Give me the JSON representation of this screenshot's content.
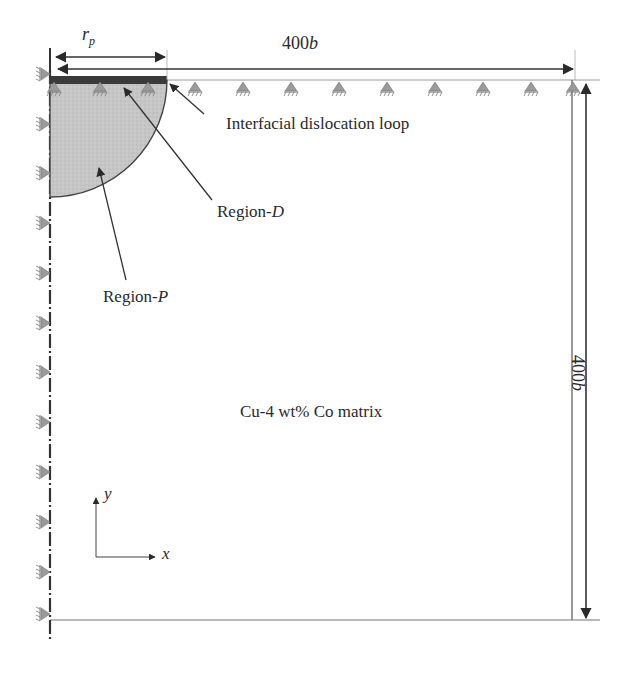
{
  "figure": {
    "type": "finite-element model schematic",
    "labels": {
      "rp_main": "r",
      "rp_sub": "p",
      "width_dim": "400",
      "width_dim_unit": "b",
      "height_dim": "400",
      "height_dim_unit": "b",
      "interfacial_loop": "Interfacial dislocation loop",
      "region_d_prefix": "Region-",
      "region_d_suffix": "D",
      "region_p_prefix": "Region-",
      "region_p_suffix": "P",
      "matrix": "Cu-4 wt% Co matrix",
      "axis_x": "x",
      "axis_y": "y"
    },
    "colors": {
      "line": "#3a3a3a",
      "region_p_fill": "#c8c8c8",
      "region_d_fill": "#3a3a3a",
      "support_fill": "#9a9a9a",
      "background": "#ffffff"
    },
    "supports": {
      "top_count": 11,
      "left_count": 12
    }
  }
}
